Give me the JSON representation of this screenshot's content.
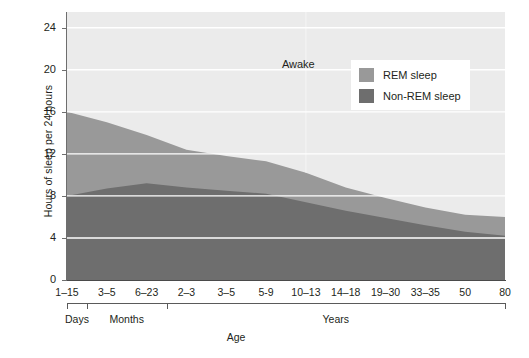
{
  "chart_data": {
    "type": "area",
    "title": "",
    "xlabel": "Age",
    "ylabel": "Hours of sleep per 24 hours",
    "ylim": [
      0,
      25.5
    ],
    "yticks": [
      0,
      4,
      8,
      12,
      16,
      20,
      24
    ],
    "grid": true,
    "stacked": true,
    "legend_position": "top-right",
    "categories": [
      "1–15",
      "3–5",
      "6–23",
      "2–3",
      "3–5",
      "5-9",
      "10–13",
      "14–18",
      "19–30",
      "33–35",
      "50",
      "80"
    ],
    "category_groups": [
      {
        "label": "Days",
        "categories": [
          "1–15"
        ]
      },
      {
        "label": "Months",
        "categories": [
          "3–5",
          "6–23"
        ]
      },
      {
        "label": "Years",
        "categories": [
          "2–3",
          "3–5",
          "5-9",
          "10–13",
          "14–18",
          "19–30",
          "33–35",
          "50",
          "80"
        ]
      }
    ],
    "series": [
      {
        "name": "Non-REM sleep",
        "color": "#6e6e6e",
        "values": [
          8.0,
          8.7,
          9.2,
          8.8,
          8.5,
          8.2,
          7.4,
          6.6,
          5.9,
          5.2,
          4.6,
          4.2
        ]
      },
      {
        "name": "REM sleep",
        "color": "#999999",
        "values": [
          8.0,
          6.3,
          4.6,
          3.6,
          3.3,
          3.1,
          2.8,
          2.2,
          1.9,
          1.7,
          1.6,
          1.8
        ]
      },
      {
        "name": "Awake",
        "color": "#ebebeb",
        "values": [
          8.0,
          9.0,
          10.2,
          11.6,
          12.2,
          12.7,
          13.8,
          15.2,
          16.2,
          17.1,
          17.8,
          18.0
        ]
      }
    ],
    "total_sleep": [
      16.0,
      15.0,
      13.8,
      12.4,
      11.8,
      11.3,
      10.2,
      8.8,
      7.8,
      6.9,
      6.2,
      6.0
    ],
    "annotations": [
      {
        "text": "Awake",
        "x_category": "10–13",
        "y_value": 20.5
      }
    ]
  },
  "axes": {
    "y_title": "Hours of sleep per 24 hours",
    "y_ticks": [
      "0",
      "4",
      "8",
      "12",
      "16",
      "20",
      "24"
    ],
    "x_ticks": [
      "1–15",
      "3–5",
      "6–23",
      "2–3",
      "3–5",
      "5-9",
      "10–13",
      "14–18",
      "19–30",
      "33–35",
      "50",
      "80"
    ],
    "x_title": "Age"
  },
  "groups": [
    {
      "label": "Days"
    },
    {
      "label": "Months"
    },
    {
      "label": "Years"
    }
  ],
  "legend": {
    "items": [
      {
        "label": "REM sleep",
        "color": "#999999"
      },
      {
        "label": "Non-REM sleep",
        "color": "#6e6e6e"
      }
    ]
  },
  "annotation": {
    "awake": "Awake"
  },
  "colors": {
    "awake_band": "#ebebeb",
    "rem_band": "#999999",
    "nonrem_band": "#6e6e6e",
    "gridline": "#ffffff",
    "axis": "#5a5a5a",
    "text": "#231f20",
    "background": "#ffffff"
  }
}
